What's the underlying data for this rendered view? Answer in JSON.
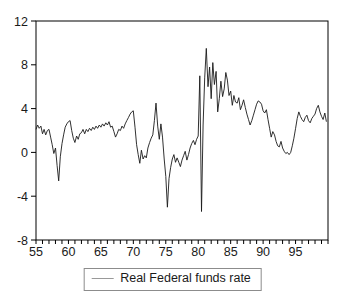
{
  "colors": {
    "background": "#ffffff",
    "frame": "#000000",
    "line": "#1a1a1a",
    "tick": "#000000",
    "text": "#1a1a1a",
    "legend_border": "#8c8c8c",
    "legend_sample": "#999999"
  },
  "chart_data": {
    "type": "line",
    "title": "",
    "xlabel": "",
    "ylabel": "",
    "grid": false,
    "xlim": [
      1955,
      2000
    ],
    "ylim": [
      -8,
      12
    ],
    "y_tick_values": [
      12,
      8,
      4,
      0,
      -4,
      -8
    ],
    "y_tick_labels": [
      "12",
      "8",
      "4",
      "0",
      "-4",
      "-8"
    ],
    "x_minor_tick_step": 1,
    "x_tick_values": [
      1955,
      1960,
      1965,
      1970,
      1975,
      1980,
      1985,
      1990,
      1995
    ],
    "x_tick_labels": [
      "55",
      "60",
      "65",
      "70",
      "75",
      "80",
      "85",
      "90",
      "95"
    ],
    "legend_position": "bottom-center",
    "series": [
      {
        "name": "Real Federal funds rate",
        "color": "#1a1a1a",
        "x_start": 1955,
        "x_step": 0.25,
        "values": [
          2.1,
          2.5,
          2.2,
          2.4,
          1.7,
          2.1,
          1.6,
          2.0,
          2.1,
          1.4,
          0.7,
          -0.1,
          0.4,
          -1.2,
          -2.6,
          -0.4,
          0.8,
          1.6,
          2.3,
          2.6,
          2.8,
          2.9,
          2.0,
          1.3,
          0.9,
          1.5,
          1.2,
          1.7,
          1.8,
          2.1,
          1.7,
          2.1,
          1.9,
          2.2,
          2.0,
          2.3,
          2.1,
          2.4,
          2.2,
          2.5,
          2.3,
          2.6,
          2.4,
          2.7,
          2.5,
          2.8,
          2.3,
          2.4,
          1.9,
          1.4,
          1.7,
          2.1,
          2.0,
          2.4,
          2.2,
          2.6,
          2.9,
          3.2,
          3.5,
          3.7,
          3.8,
          2.3,
          0.7,
          -0.2,
          -1.0,
          0.2,
          -0.6,
          -0.3,
          -0.5,
          0.4,
          0.9,
          1.3,
          1.6,
          2.9,
          4.5,
          2.4,
          1.2,
          2.6,
          1.4,
          -0.6,
          -2.2,
          -5.0,
          -2.4,
          -1.4,
          -0.6,
          -0.2,
          -0.9,
          -0.5,
          -0.9,
          -1.3,
          -0.7,
          -0.3,
          0.1,
          -0.7,
          -0.2,
          0.4,
          0.8,
          1.1,
          0.7,
          1.2,
          1.5,
          7.0,
          -5.4,
          2.5,
          6.8,
          9.5,
          6.0,
          7.8,
          4.9,
          8.2,
          6.2,
          7.4,
          3.7,
          4.9,
          6.5,
          5.1,
          5.8,
          7.3,
          6.6,
          5.2,
          5.6,
          4.3,
          5.2,
          4.6,
          4.5,
          5.0,
          3.9,
          4.3,
          4.8,
          4.1,
          3.5,
          3.0,
          2.5,
          2.9,
          3.4,
          3.9,
          4.4,
          4.7,
          4.6,
          4.4,
          3.8,
          3.6,
          3.9,
          3.0,
          2.2,
          1.4,
          1.9,
          1.6,
          1.0,
          0.6,
          0.5,
          1.0,
          0.4,
          0.1,
          -0.1,
          0.0,
          -0.2,
          0.0,
          0.6,
          1.3,
          2.2,
          3.1,
          3.7,
          3.3,
          3.0,
          2.8,
          3.2,
          3.4,
          2.9,
          2.7,
          3.1,
          3.3,
          3.5,
          4.0,
          4.3,
          3.7,
          3.3,
          3.0,
          3.6,
          2.8
        ]
      }
    ]
  }
}
